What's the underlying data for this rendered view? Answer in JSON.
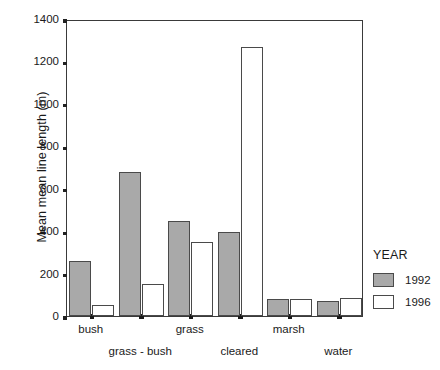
{
  "chart_data": {
    "type": "bar",
    "title": "",
    "xlabel": "",
    "ylabel": "Mean mean line length (m)",
    "categories": [
      "bush",
      "grass - bush",
      "grass",
      "cleared",
      "marsh",
      "water"
    ],
    "series": [
      {
        "name": "1992",
        "color": "#a9a9a9",
        "values": [
          260,
          680,
          450,
          395,
          78,
          70
        ]
      },
      {
        "name": "1996",
        "color": "#ffffff",
        "values": [
          50,
          150,
          350,
          1270,
          80,
          85
        ]
      }
    ],
    "ylim": [
      0,
      1400
    ],
    "yticks": [
      0,
      200,
      400,
      600,
      800,
      1000,
      1200,
      1400
    ],
    "ytick_labels": [
      "0",
      "200",
      "400",
      "600",
      "800",
      "1000",
      "1200",
      "1400"
    ],
    "grid": false,
    "legend": {
      "title": "YEAR",
      "position": "right",
      "entries": [
        "1992",
        "1996"
      ]
    }
  },
  "axis": {
    "y_title": "Mean mean line length (m)"
  },
  "legend": {
    "title": "YEAR",
    "items": [
      {
        "label": "1992",
        "swatch": "y1992"
      },
      {
        "label": "1996",
        "swatch": "y1996"
      }
    ]
  }
}
